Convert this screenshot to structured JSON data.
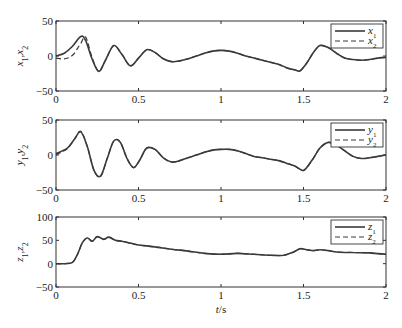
{
  "chart_data": [
    {
      "type": "line",
      "title": "",
      "xlabel": "",
      "ylabel": "x1, x2",
      "ylabel_main": [
        "x",
        "1",
        ",",
        "x",
        "2"
      ],
      "xlim": [
        0,
        2
      ],
      "ylim": [
        -50,
        50
      ],
      "xticks": [
        0,
        0.5,
        1,
        1.5,
        2
      ],
      "xtick_labels": [
        "0",
        "0.5",
        "1",
        "1.5",
        "2"
      ],
      "yticks": [
        -50,
        0,
        50
      ],
      "ytick_labels": [
        "−50",
        "0",
        "50"
      ],
      "grid": false,
      "legend_position": "top-right",
      "x": [
        0,
        0.05,
        0.1,
        0.15,
        0.18,
        0.22,
        0.26,
        0.3,
        0.35,
        0.4,
        0.45,
        0.5,
        0.55,
        0.6,
        0.65,
        0.7,
        0.75,
        0.8,
        0.85,
        0.9,
        0.95,
        1.0,
        1.05,
        1.1,
        1.15,
        1.2,
        1.25,
        1.3,
        1.35,
        1.4,
        1.45,
        1.48,
        1.52,
        1.56,
        1.6,
        1.65,
        1.7,
        1.75,
        1.8,
        1.85,
        1.9,
        1.95,
        2.0
      ],
      "series": [
        {
          "name": "x1",
          "legend_label": [
            "x",
            "1"
          ],
          "style": "solid",
          "values": [
            0,
            4,
            14,
            28,
            22,
            -5,
            -22,
            -6,
            15,
            2,
            -14,
            -3,
            9,
            5,
            -4,
            -8,
            -7,
            -4,
            0,
            4,
            7,
            8,
            7,
            4,
            0,
            -3,
            -6,
            -9,
            -12,
            -17,
            -20,
            -21,
            -10,
            5,
            15,
            12,
            4,
            -3,
            -5,
            -6,
            -5,
            -3,
            -2
          ]
        },
        {
          "name": "x2",
          "legend_label": [
            "x",
            "2"
          ],
          "style": "dashed",
          "values": [
            -3,
            -4,
            1,
            18,
            27,
            -3,
            -22,
            -6,
            15,
            2,
            -14,
            -3,
            9,
            5,
            -4,
            -8,
            -7,
            -4,
            0,
            4,
            7,
            8,
            7,
            4,
            0,
            -3,
            -6,
            -9,
            -12,
            -17,
            -20,
            -21,
            -10,
            5,
            15,
            12,
            4,
            -3,
            -5,
            -6,
            -5,
            -3,
            -2
          ]
        }
      ]
    },
    {
      "type": "line",
      "title": "",
      "xlabel": "",
      "ylabel": "y1, y2",
      "ylabel_main": [
        "y",
        "1",
        ",",
        "y",
        "2"
      ],
      "xlim": [
        0,
        2
      ],
      "ylim": [
        -50,
        50
      ],
      "xticks": [
        0,
        0.5,
        1,
        1.5,
        2
      ],
      "xtick_labels": [
        "0",
        "0.5",
        "1",
        "1.5",
        "2"
      ],
      "yticks": [
        -50,
        0,
        50
      ],
      "ytick_labels": [
        "−50",
        "0",
        "50"
      ],
      "grid": false,
      "legend_position": "top-right",
      "x": [
        0,
        0.03,
        0.07,
        0.11,
        0.15,
        0.19,
        0.23,
        0.27,
        0.31,
        0.35,
        0.39,
        0.43,
        0.47,
        0.51,
        0.55,
        0.6,
        0.65,
        0.7,
        0.75,
        0.8,
        0.85,
        0.9,
        0.95,
        1.0,
        1.05,
        1.1,
        1.15,
        1.2,
        1.25,
        1.3,
        1.35,
        1.4,
        1.45,
        1.5,
        1.55,
        1.6,
        1.65,
        1.7,
        1.75,
        1.8,
        1.85,
        1.9,
        1.95,
        2.0
      ],
      "series": [
        {
          "name": "y1",
          "legend_label": [
            "y",
            "1"
          ],
          "style": "solid",
          "values": [
            2,
            5,
            10,
            22,
            33,
            12,
            -22,
            -30,
            -5,
            20,
            18,
            -5,
            -18,
            -6,
            10,
            8,
            -4,
            -10,
            -8,
            -4,
            0,
            4,
            7,
            8,
            8,
            6,
            2,
            -2,
            -4,
            -6,
            -8,
            -12,
            -16,
            -22,
            -8,
            10,
            18,
            14,
            6,
            -2,
            -5,
            -4,
            -2,
            0
          ]
        },
        {
          "name": "y2",
          "legend_label": [
            "y",
            "2"
          ],
          "style": "dashed",
          "values": [
            0,
            4,
            9,
            22,
            34,
            12,
            -22,
            -31,
            -5,
            20,
            18,
            -5,
            -18,
            -6,
            10,
            8,
            -4,
            -10,
            -8,
            -4,
            0,
            4,
            7,
            8,
            8,
            6,
            2,
            -2,
            -4,
            -6,
            -8,
            -12,
            -16,
            -22,
            -8,
            10,
            18,
            14,
            6,
            -2,
            -5,
            -4,
            -2,
            0
          ]
        }
      ]
    },
    {
      "type": "line",
      "title": "",
      "xlabel": "t/s",
      "xlabel_main": "t",
      "xlabel_unit": "/s",
      "ylabel": "z1, z2",
      "ylabel_main": [
        "z",
        "1",
        ",",
        "z",
        "2"
      ],
      "xlim": [
        0,
        2
      ],
      "ylim": [
        -50,
        100
      ],
      "xticks": [
        0,
        0.5,
        1,
        1.5,
        2
      ],
      "xtick_labels": [
        "0",
        "0.5",
        "1",
        "1.5",
        "2"
      ],
      "yticks": [
        -50,
        0,
        50,
        100
      ],
      "ytick_labels": [
        "−50",
        "0",
        "50",
        "100"
      ],
      "grid": false,
      "legend_position": "top-right",
      "x": [
        0,
        0.05,
        0.1,
        0.13,
        0.16,
        0.19,
        0.22,
        0.25,
        0.29,
        0.32,
        0.36,
        0.4,
        0.45,
        0.5,
        0.55,
        0.6,
        0.7,
        0.8,
        0.9,
        1.0,
        1.1,
        1.2,
        1.3,
        1.38,
        1.44,
        1.48,
        1.52,
        1.56,
        1.6,
        1.65,
        1.7,
        1.75,
        1.8,
        1.9,
        2.0
      ],
      "series": [
        {
          "name": "z1",
          "legend_label": [
            "z",
            "1"
          ],
          "style": "solid",
          "values": [
            0,
            0,
            3,
            20,
            45,
            55,
            48,
            58,
            52,
            57,
            50,
            48,
            44,
            40,
            38,
            36,
            31,
            27,
            22,
            20,
            22,
            20,
            18,
            18,
            25,
            32,
            30,
            28,
            30,
            28,
            25,
            24,
            24,
            23,
            20
          ]
        },
        {
          "name": "z2",
          "legend_label": [
            "z",
            "2"
          ],
          "style": "dashed",
          "values": [
            0,
            0,
            3,
            20,
            45,
            55,
            48,
            58,
            52,
            57,
            50,
            48,
            44,
            40,
            38,
            36,
            31,
            27,
            22,
            20,
            22,
            20,
            18,
            18,
            25,
            32,
            30,
            28,
            30,
            28,
            25,
            24,
            24,
            23,
            20
          ]
        }
      ]
    }
  ]
}
